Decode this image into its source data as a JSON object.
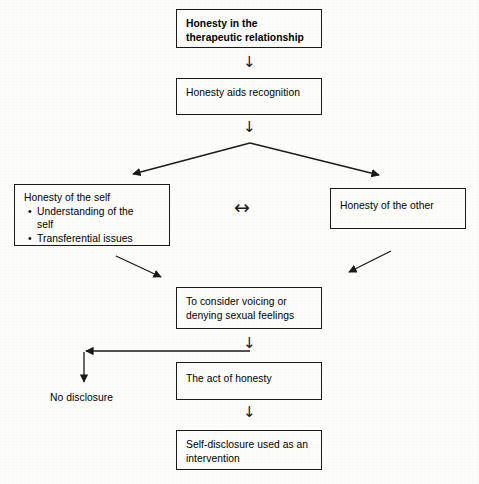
{
  "diagram": {
    "background_color": "#fdfdfc",
    "line_color": "#1a1a1a",
    "nodes": {
      "root": {
        "label": "Honesty in the\ntherapeutic relationship",
        "bold": true,
        "x": 176,
        "y": 9,
        "w": 146,
        "h": 39
      },
      "recognition": {
        "label": "Honesty aids recognition",
        "bold": false,
        "x": 176,
        "y": 78,
        "w": 146,
        "h": 37
      },
      "self": {
        "heading": "Honesty of the self",
        "bullets": [
          "Understanding of the\n self",
          "Transferential issues"
        ],
        "x": 14,
        "y": 184,
        "w": 156,
        "h": 62
      },
      "other": {
        "label": "Honesty of the other",
        "bold": false,
        "x": 330,
        "y": 188,
        "w": 136,
        "h": 41
      },
      "consider": {
        "label": "To consider voicing or\ndenying sexual feelings",
        "bold": false,
        "x": 176,
        "y": 287,
        "w": 146,
        "h": 42
      },
      "act": {
        "label": "The act of honesty",
        "bold": false,
        "x": 176,
        "y": 362,
        "w": 146,
        "h": 38
      },
      "selfdisclosure": {
        "label": "Self-disclosure used as an\nintervention",
        "bold": false,
        "x": 176,
        "y": 430,
        "w": 146,
        "h": 40
      }
    },
    "floating_labels": {
      "no_disclosure": {
        "label": "No disclosure",
        "x": 50,
        "y": 391
      }
    },
    "arrow_glyphs": {
      "root_to_recognition": {
        "glyph": "↓",
        "x": 243,
        "y": 55
      },
      "recognition_to_branch": {
        "glyph": "↓",
        "x": 243,
        "y": 120
      },
      "self_other_bidirectional": {
        "glyph": "↔",
        "x": 234,
        "y": 200
      },
      "consider_to_act": {
        "glyph": "↓",
        "x": 243,
        "y": 336
      },
      "act_to_selfdisclosure": {
        "glyph": "↓",
        "x": 243,
        "y": 405
      }
    },
    "connector_lines": {
      "branch_left": {
        "from": [
          250,
          143
        ],
        "to": [
          131,
          175
        ]
      },
      "branch_right": {
        "from": [
          250,
          143
        ],
        "to": [
          381,
          176
        ]
      },
      "self_to_consider": {
        "from": [
          116,
          256
        ],
        "to": [
          163,
          278
        ]
      },
      "other_to_consider": {
        "from": [
          391,
          251
        ],
        "to": [
          347,
          273
        ]
      },
      "split_horizontal": {
        "from": [
          250,
          351
        ],
        "to": [
          84,
          351
        ]
      },
      "split_down_to_no_disclosure": {
        "from": [
          84,
          351
        ],
        "to": [
          84,
          384
        ]
      }
    }
  }
}
